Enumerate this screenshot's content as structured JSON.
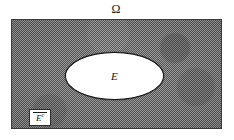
{
  "figure": {
    "kind": "set-theory-venn-diagram",
    "universe": {
      "symbol": "Ω",
      "name": "sample-space",
      "fill_description": "shaded halftone gray",
      "fill_color": "#9a9a9a",
      "border_color": "#3a3a3a"
    },
    "event": {
      "symbol": "E",
      "name": "event-set",
      "fill_color": "#ffffff",
      "border_color": "#141414"
    },
    "complement": {
      "symbol": "E",
      "superscript": "c",
      "overline": true,
      "box_fill": "#ffffff",
      "box_border": "#2e2e2e"
    },
    "background_color": "#ffffff"
  }
}
